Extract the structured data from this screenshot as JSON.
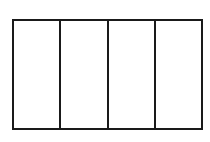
{
  "diagram": {
    "type": "rectangle-divided-into-equal-parts",
    "columns": 4,
    "rows": 1,
    "shaded_parts": 0,
    "stroke_color": "#1a1a1a",
    "fill_color": "#ffffff",
    "cells": [
      {
        "index": 1,
        "label": ""
      },
      {
        "index": 2,
        "label": ""
      },
      {
        "index": 3,
        "label": ""
      },
      {
        "index": 4,
        "label": ""
      }
    ]
  }
}
